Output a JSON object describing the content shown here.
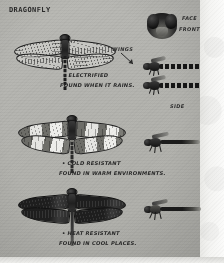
{
  "page": {
    "title": "DRAGONFLY",
    "background_color": "#b4b4af",
    "ink_color": "#242424"
  },
  "labels": {
    "face": "FACE",
    "front": "FRONT",
    "wings": "WINGS",
    "side": "SIDE"
  },
  "specimens": [
    {
      "id": "specimen-1",
      "wing_style": "clear-veined",
      "notes": [
        "• ELECTRIFIED",
        "FOUND WHEN IT RAINS."
      ]
    },
    {
      "id": "specimen-2",
      "wing_style": "banded",
      "notes": [
        "• COLD RESISTANT",
        "FOUND IN WARM ENVIRONMENTS."
      ]
    },
    {
      "id": "specimen-3",
      "wing_style": "solid-dark",
      "notes": [
        "• HEAT RESISTANT",
        "FOUND IN COOL PLACES."
      ]
    }
  ]
}
